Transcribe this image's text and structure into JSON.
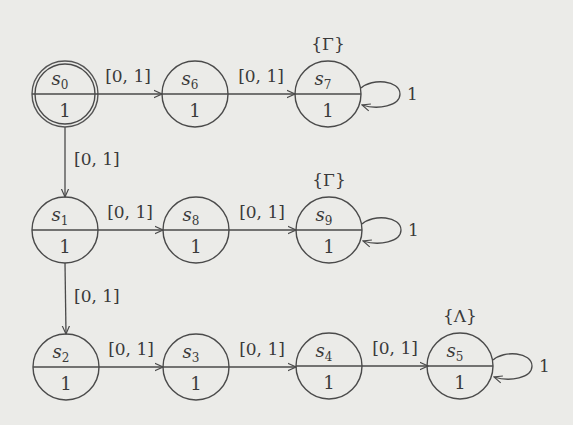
{
  "diagram": {
    "type": "state transition diagram",
    "states": [
      {
        "id": "s0",
        "name": "s",
        "sub": "0",
        "reward": "1",
        "cx": 65,
        "cy": 94,
        "initial": true
      },
      {
        "id": "s6",
        "name": "s",
        "sub": "6",
        "reward": "1",
        "cx": 195,
        "cy": 94
      },
      {
        "id": "s7",
        "name": "s",
        "sub": "7",
        "reward": "1",
        "cx": 328,
        "cy": 94,
        "set_label": "{Γ}",
        "self_loop": "1"
      },
      {
        "id": "s1",
        "name": "s",
        "sub": "1",
        "reward": "1",
        "cx": 65,
        "cy": 230
      },
      {
        "id": "s8",
        "name": "s",
        "sub": "8",
        "reward": "1",
        "cx": 196,
        "cy": 230
      },
      {
        "id": "s9",
        "name": "s",
        "sub": "9",
        "reward": "1",
        "cx": 329,
        "cy": 230,
        "set_label": "{Γ}",
        "self_loop": "1"
      },
      {
        "id": "s2",
        "name": "s",
        "sub": "2",
        "reward": "1",
        "cx": 66,
        "cy": 367
      },
      {
        "id": "s3",
        "name": "s",
        "sub": "3",
        "reward": "1",
        "cx": 196,
        "cy": 367
      },
      {
        "id": "s4",
        "name": "s",
        "sub": "4",
        "reward": "1",
        "cx": 329,
        "cy": 366
      },
      {
        "id": "s5",
        "name": "s",
        "sub": "5",
        "reward": "1",
        "cx": 460,
        "cy": 366,
        "set_label": "{Λ}",
        "self_loop": "1"
      }
    ],
    "transitions": [
      {
        "from": "s0",
        "to": "s6",
        "label": "[0, 1]"
      },
      {
        "from": "s6",
        "to": "s7",
        "label": "[0, 1]"
      },
      {
        "from": "s0",
        "to": "s1",
        "label": "[0, 1]"
      },
      {
        "from": "s1",
        "to": "s8",
        "label": "[0, 1]"
      },
      {
        "from": "s8",
        "to": "s9",
        "label": "[0, 1]"
      },
      {
        "from": "s1",
        "to": "s2",
        "label": "[0, 1]"
      },
      {
        "from": "s2",
        "to": "s3",
        "label": "[0, 1]"
      },
      {
        "from": "s3",
        "to": "s4",
        "label": "[0, 1]"
      },
      {
        "from": "s4",
        "to": "s5",
        "label": "[0, 1]"
      },
      {
        "from": "s7",
        "to": "s7",
        "label": "1"
      },
      {
        "from": "s9",
        "to": "s9",
        "label": "1"
      },
      {
        "from": "s5",
        "to": "s5",
        "label": "1"
      }
    ]
  },
  "labels": {
    "edge_interval": "[0, 1]",
    "loop_prob": "1",
    "set_gamma": "{Γ}",
    "set_lambda": "{Λ}",
    "reward": "1",
    "state_letter": "s",
    "subs": {
      "s0": "0",
      "s1": "1",
      "s2": "2",
      "s3": "3",
      "s4": "4",
      "s5": "5",
      "s6": "6",
      "s7": "7",
      "s8": "8",
      "s9": "9"
    }
  }
}
